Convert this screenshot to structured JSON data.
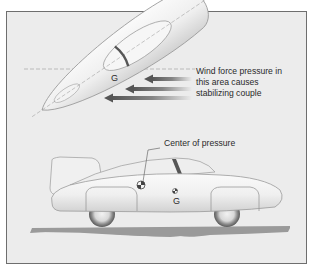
{
  "diagram": {
    "type": "aerodynamic stability illustration",
    "top_view": {
      "center_of_gravity_label": "G",
      "annotation_lines": [
        "Wind force pressure in",
        "this area causes",
        "stabilizing couple"
      ],
      "arrow_count": 3
    },
    "side_view": {
      "center_of_pressure_label": "Center of pressure",
      "center_of_gravity_label": "G"
    },
    "colors": {
      "panel_background": "#ececec",
      "frame_border": "#6e6e6e",
      "body_fill": "#f4f4f4",
      "arrow": "#6a6a6a",
      "ground": "#9a9a9a",
      "text": "#2a2a2a"
    }
  }
}
